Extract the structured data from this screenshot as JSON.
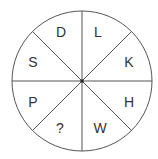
{
  "diagram": {
    "type": "letter-wheel-puzzle",
    "center": [
      82,
      81
    ],
    "radius": 70,
    "stroke_color": "#555555",
    "segments": [
      {
        "position": "top-left",
        "label": "D",
        "x": 61,
        "y": 32
      },
      {
        "position": "top-right",
        "label": "L",
        "x": 98,
        "y": 32
      },
      {
        "position": "right-top",
        "label": "K",
        "x": 129,
        "y": 62
      },
      {
        "position": "right-bottom",
        "label": "H",
        "x": 129,
        "y": 102
      },
      {
        "position": "bottom-right",
        "label": "W",
        "x": 100,
        "y": 128
      },
      {
        "position": "bottom-left",
        "label": "?",
        "x": 60,
        "y": 128
      },
      {
        "position": "left-bottom",
        "label": "P",
        "x": 33,
        "y": 102
      },
      {
        "position": "left-top",
        "label": "S",
        "x": 33,
        "y": 62
      }
    ]
  }
}
